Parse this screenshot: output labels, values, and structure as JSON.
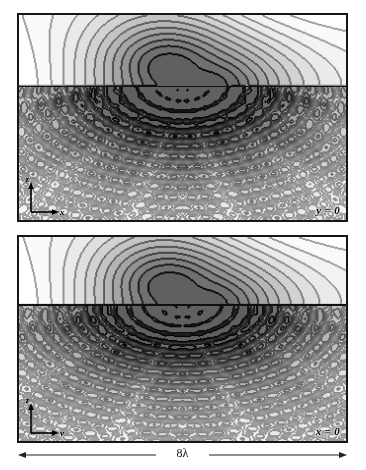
{
  "figure": {
    "background_color": "#ffffff",
    "border_color": "#161616"
  },
  "panels": [
    {
      "id": "panel-top",
      "label": "y = 0",
      "label_name": "panel-label-y0",
      "axis_vertical": "z",
      "axis_horizontal": "x",
      "interface_fraction": 0.345,
      "focus_x_fraction": 0.5
    },
    {
      "id": "panel-bottom",
      "label": "x = 0",
      "label_name": "panel-label-x0",
      "axis_vertical": "z",
      "axis_horizontal": "y",
      "interface_fraction": 0.33,
      "focus_x_fraction": 0.5
    }
  ],
  "scale_bar": {
    "value": "8",
    "unit": "λ",
    "text": "8λ"
  },
  "chart_data": {
    "type": "heatmap",
    "title": "",
    "xlabel": "",
    "ylabel": "",
    "subplots": [
      {
        "name": "y = 0 plane",
        "xlabel": "x",
        "ylabel": "z",
        "plane": "y=0",
        "xlim": [
          -4,
          4
        ],
        "xunit": "λ",
        "grid": false,
        "colormap": "grayscale-inverted",
        "interface_z_fraction": 0.345,
        "focus": {
          "x": 0.0,
          "z_fraction": 0.345,
          "peak_level": 1.0
        },
        "contour_levels": [
          0.05,
          0.1,
          0.2,
          0.3,
          0.4,
          0.5,
          0.6,
          0.7,
          0.8,
          0.9
        ],
        "upper_region": "smooth broad lobes, low amplitude",
        "lower_region": "fine oscillatory interference fringes radiating from focus"
      },
      {
        "name": "x = 0 plane",
        "xlabel": "y",
        "ylabel": "z",
        "plane": "x=0",
        "xlim": [
          -4,
          4
        ],
        "xunit": "λ",
        "grid": false,
        "colormap": "grayscale-inverted",
        "interface_z_fraction": 0.33,
        "focus": {
          "y": 0.0,
          "z_fraction": 0.33,
          "peak_level": 1.0
        },
        "contour_levels": [
          0.05,
          0.1,
          0.2,
          0.3,
          0.4,
          0.5,
          0.6,
          0.7,
          0.8,
          0.9
        ],
        "upper_region": "smooth broad lobes, low amplitude",
        "lower_region": "fine concentric-arc interference fringes"
      }
    ],
    "shared_width_label": "8λ"
  }
}
